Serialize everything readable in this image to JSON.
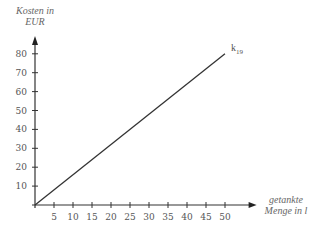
{
  "chart_data": {
    "type": "line",
    "title": "",
    "xlabel": "getankte Menge in l",
    "xlabel_lines": [
      "getankte",
      "Menge in l"
    ],
    "ylabel": "Kosten in EUR",
    "ylabel_lines": [
      "Kosten in",
      "EUR"
    ],
    "x_ticks": [
      5,
      10,
      15,
      20,
      25,
      30,
      35,
      40,
      45,
      50
    ],
    "y_ticks": [
      10,
      20,
      30,
      40,
      50,
      60,
      70,
      80
    ],
    "xlim": [
      0,
      52
    ],
    "ylim": [
      0,
      85
    ],
    "grid": false,
    "series": [
      {
        "name": "k19",
        "label_main": "k",
        "label_sub": "19",
        "x": [
          0,
          50
        ],
        "y": [
          0,
          80
        ],
        "color": "#333333"
      }
    ]
  },
  "layout": {
    "origin_px": [
      35,
      205
    ],
    "x_px_per_unit": 3.8,
    "y_px_per_unit": 1.89
  }
}
